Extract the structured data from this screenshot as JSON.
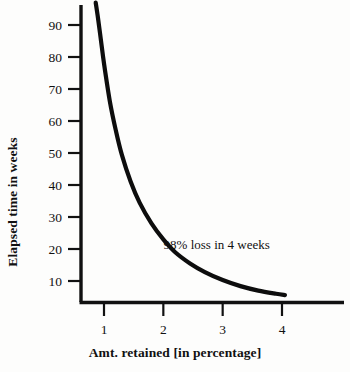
{
  "chart_data": {
    "type": "line",
    "title": "",
    "xlabel": "Amt. retained [in percentage]",
    "ylabel": "Elapsed time in weeks",
    "xlim": [
      0.78,
      4.3
    ],
    "ylim": [
      0,
      99
    ],
    "grid": false,
    "legend": null,
    "x_ticks": [
      "1",
      "2",
      "3",
      "4"
    ],
    "x_tick_values": [
      1,
      2,
      3,
      4
    ],
    "y_ticks": [
      "10",
      "20",
      "30",
      "40",
      "50",
      "60",
      "70",
      "80",
      "90"
    ],
    "y_tick_values": [
      10,
      20,
      30,
      40,
      50,
      60,
      70,
      80,
      90
    ],
    "series": [
      {
        "name": "forgetting curve",
        "x": [
          0.86,
          0.9,
          0.95,
          1.0,
          1.1,
          1.2,
          1.3,
          1.45,
          1.6,
          1.8,
          2.0,
          2.2,
          2.45,
          2.7,
          3.0,
          3.3,
          3.6,
          3.9,
          4.05
        ],
        "y": [
          97.0,
          92.0,
          85.0,
          78.0,
          66.0,
          57.0,
          49.5,
          41.0,
          34.5,
          28.0,
          23.0,
          19.0,
          15.5,
          12.8,
          10.3,
          8.4,
          7.0,
          6.0,
          5.6
        ]
      }
    ],
    "annotations": [
      {
        "text": "98% loss in 4 weeks",
        "x": 2.9,
        "y": 20
      }
    ]
  },
  "axis_color": "#111111",
  "curve_color": "#0d0d0d",
  "background_color": "#fdfdfc"
}
